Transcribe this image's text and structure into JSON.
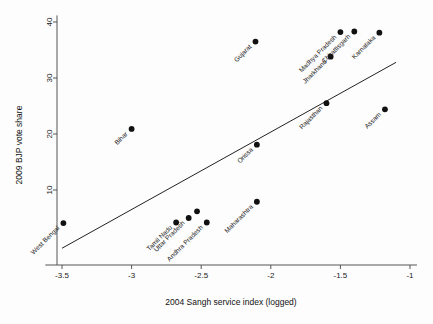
{
  "chart_data": {
    "type": "scatter",
    "title": "",
    "xlabel": "2004 Sangh service index (logged)",
    "ylabel": "2009 BJP vote share",
    "xlim": [
      -3.62,
      -0.95
    ],
    "ylim": [
      -0.6,
      41
    ],
    "xticks": [
      -3.5,
      -3,
      -2.5,
      -2,
      -1.5,
      -1
    ],
    "xticklabels": [
      "-3.5",
      "-3",
      "-2.5",
      "-2",
      "-1.5",
      "-1"
    ],
    "yticks": [
      10,
      20,
      30,
      40
    ],
    "yticklabels": [
      "10",
      "20",
      "30",
      "40"
    ],
    "grid": false,
    "legend": "none",
    "marker_color": "#111111",
    "line_color": "#222222",
    "points": [
      {
        "label": "West Bengal",
        "x": -3.49,
        "y": 4.1
      },
      {
        "label": "Bihar",
        "x": -3.0,
        "y": 20.9
      },
      {
        "label": "Tamil Nadu",
        "x": -2.68,
        "y": 4.2
      },
      {
        "label": "Uttar Pradesh",
        "x": -2.59,
        "y": 5.0
      },
      {
        "label": "",
        "x": -2.53,
        "y": 6.2
      },
      {
        "label": "Andhra Pradesh",
        "x": -2.46,
        "y": 4.2
      },
      {
        "label": "Maharashtra",
        "x": -2.1,
        "y": 7.9
      },
      {
        "label": "Orissa",
        "x": -2.1,
        "y": 18.1
      },
      {
        "label": "Gujarat",
        "x": -2.11,
        "y": 36.5
      },
      {
        "label": "Rajasthan",
        "x": -1.6,
        "y": 25.5
      },
      {
        "label": "Madhya Pradesh",
        "x": -1.5,
        "y": 38.2
      },
      {
        "label": "Jharkhand",
        "x": -1.57,
        "y": 33.8
      },
      {
        "label": "Chhattisgarh",
        "x": -1.4,
        "y": 38.3
      },
      {
        "label": "Karnataka",
        "x": -1.22,
        "y": 38.1
      },
      {
        "label": "Assam",
        "x": -1.18,
        "y": 24.4
      }
    ],
    "fit_line": {
      "x1": -3.5,
      "y1": -0.4,
      "x2": -1.1,
      "y2": 32.8
    }
  }
}
